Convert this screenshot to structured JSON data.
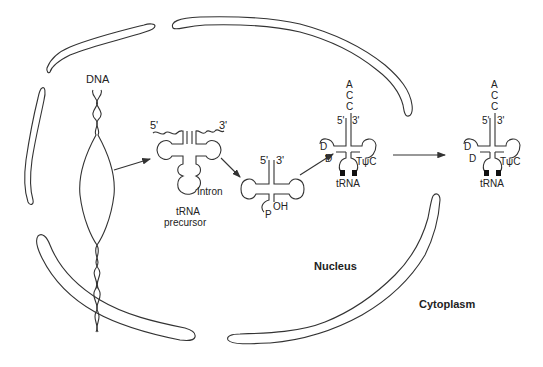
{
  "diagram": {
    "compartments": {
      "nucleus_label": "Nucleus",
      "cytoplasm_label": "Cytoplasm"
    },
    "stages": [
      {
        "id": "dna",
        "label": "DNA"
      },
      {
        "id": "precursor",
        "label_line1": "tRNA",
        "label_line2": "precursor",
        "intron_label": "Intron",
        "five_prime": "5'",
        "three_prime": "3'"
      },
      {
        "id": "spliced",
        "five_prime": "5'",
        "three_prime": "3'",
        "phosphate": "P",
        "hydroxyl": "OH"
      },
      {
        "id": "mature_nuclear",
        "label": "tRNA",
        "five_prime": "5'",
        "three_prime": "3'",
        "acc_tail": [
          "A",
          "C",
          "C"
        ],
        "d_mods": [
          "D",
          "D"
        ],
        "tpsic": "TψC"
      },
      {
        "id": "mature_cytoplasm",
        "label": "tRNA",
        "five_prime": "5'",
        "three_prime": "3'",
        "acc_tail": [
          "A",
          "C",
          "C"
        ],
        "d_mods": [
          "D",
          "D"
        ],
        "tpsic": "TψC"
      }
    ]
  }
}
